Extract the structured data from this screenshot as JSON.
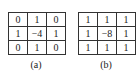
{
  "panels": [
    {
      "label": "(a)",
      "matrix": [
        [
          "0",
          "1",
          "0"
        ],
        [
          "1",
          "−4",
          "1"
        ],
        [
          "0",
          "1",
          "0"
        ]
      ]
    },
    {
      "label": "(b)",
      "matrix": [
        [
          "1",
          "1",
          "1"
        ],
        [
          "1",
          "−8",
          "1"
        ],
        [
          "1",
          "1",
          "1"
        ]
      ]
    }
  ]
}
